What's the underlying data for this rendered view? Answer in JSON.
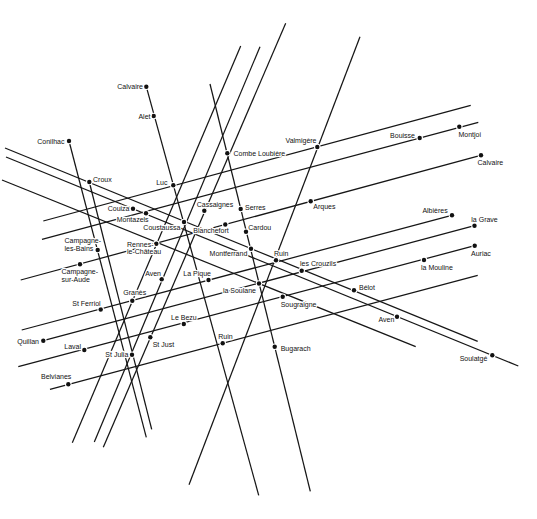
{
  "map": {
    "paper": "#ffffff",
    "ink": "#161616",
    "lines": [
      {
        "from": [
          5,
          148
        ],
        "to": [
          477.7,
          341.3
        ]
      },
      {
        "from": [
          6,
          157
        ],
        "to": [
          518.3,
          366
        ]
      },
      {
        "from": [
          2,
          180
        ],
        "to": [
          415.7,
          346.7
        ]
      },
      {
        "from": [
          43.3,
          221
        ],
        "to": [
          470.7,
          105.3
        ]
      },
      {
        "from": [
          42,
          239.3
        ],
        "to": [
          478.3,
          122.3
        ]
      },
      {
        "from": [
          20.7,
          280
        ],
        "to": [
          480.7,
          155.3
        ]
      },
      {
        "from": [
          21.7,
          330
        ],
        "to": [
          451.7,
          215.3
        ]
      },
      {
        "from": [
          43.3,
          340.7
        ],
        "to": [
          474.5,
          225.7
        ]
      },
      {
        "from": [
          18.3,
          366.7
        ],
        "to": [
          474.7,
          245.7
        ]
      },
      {
        "from": [
          50,
          389.3
        ],
        "to": [
          477.7,
          275.3
        ]
      },
      {
        "from": [
          146.3,
          86.7
        ],
        "to": [
          258.7,
          495.3
        ]
      },
      {
        "from": [
          210,
          84
        ],
        "to": [
          310.3,
          491.3
        ]
      },
      {
        "from": [
          69,
          141
        ],
        "to": [
          146.3,
          437.3
        ]
      },
      {
        "from": [
          89.3,
          182
        ],
        "to": [
          151.7,
          429.3
        ]
      },
      {
        "from": [
          240.7,
          46
        ],
        "to": [
          72.3,
          442.7
        ]
      },
      {
        "from": [
          260,
          46.7
        ],
        "to": [
          94.3,
          442
        ]
      },
      {
        "from": [
          285.7,
          23.3
        ],
        "to": [
          103.3,
          447.3
        ]
      },
      {
        "from": [
          360,
          36.7
        ],
        "to": [
          189,
          484.7
        ]
      }
    ],
    "places": [
      {
        "label": [
          "Calvaire"
        ],
        "dot": [
          146.3,
          86.7
        ],
        "text_at": [
          143,
          89
        ],
        "anchor": "end"
      },
      {
        "label": [
          "Alet"
        ],
        "dot": [
          153.7,
          116
        ],
        "text_at": [
          150.5,
          118.5
        ],
        "anchor": "end"
      },
      {
        "label": [
          "Conilhac"
        ],
        "dot": [
          69,
          141
        ],
        "text_at": [
          64.5,
          143.5
        ],
        "anchor": "end"
      },
      {
        "label": [
          "Combe Loubière"
        ],
        "dot": [
          227.3,
          153.3
        ],
        "text_at": [
          233.5,
          155.8
        ],
        "anchor": "start"
      },
      {
        "label": [
          "Valmigère"
        ],
        "dot": [
          317.3,
          147
        ],
        "text_at": [
          316.5,
          142.5
        ],
        "anchor": "end"
      },
      {
        "label": [
          "Bouisse"
        ],
        "dot": [
          419.7,
          138
        ],
        "text_at": [
          415,
          137.5
        ],
        "anchor": "end"
      },
      {
        "label": [
          "Montjoi"
        ],
        "dot": [
          459.3,
          126.7
        ],
        "text_at": [
          458.5,
          136.5
        ],
        "anchor": "start"
      },
      {
        "label": [
          "Calvaire"
        ],
        "dot": [
          481,
          155.3
        ],
        "text_at": [
          477.5,
          165
        ],
        "anchor": "start"
      },
      {
        "label": [
          "Croux"
        ],
        "dot": [
          89.3,
          182
        ],
        "text_at": [
          93,
          181.5
        ],
        "anchor": "start"
      },
      {
        "label": [
          "Luc"
        ],
        "dot": [
          173.3,
          185.3
        ],
        "text_at": [
          167.5,
          185
        ],
        "anchor": "end"
      },
      {
        "label": [
          "Couiza"
        ],
        "dot": [
          133,
          208.7
        ],
        "text_at": [
          129.5,
          211
        ],
        "anchor": "end"
      },
      {
        "label": [
          "Montazels"
        ],
        "dot": [
          146,
          213.3
        ],
        "text_at": [
          116.7,
          221.8
        ],
        "anchor": "start"
      },
      {
        "label": [
          "Cassaignes"
        ],
        "dot": [
          204.3,
          210.7
        ],
        "text_at": [
          196.7,
          207.3
        ],
        "anchor": "start"
      },
      {
        "label": [
          "Serres"
        ],
        "dot": [
          240.7,
          209
        ],
        "text_at": [
          245,
          209.5
        ],
        "anchor": "start"
      },
      {
        "label": [
          "Arques"
        ],
        "dot": [
          310.7,
          201.3
        ],
        "text_at": [
          313.3,
          208.8
        ],
        "anchor": "start"
      },
      {
        "label": [
          "Coustaussa"
        ],
        "dot": [
          184,
          222
        ],
        "text_at": [
          180.3,
          229.8
        ],
        "anchor": "end"
      },
      {
        "label": [
          "Blanchefort"
        ],
        "dot": [
          225.3,
          224.5
        ],
        "text_at": [
          193.3,
          233.2
        ],
        "anchor": "start"
      },
      {
        "label": [
          "Cardou"
        ],
        "dot": [
          246,
          231.7
        ],
        "text_at": [
          248.3,
          229.8
        ],
        "anchor": "start"
      },
      {
        "label": [
          "Campagne-",
          "les-Bains"
        ],
        "dot": [
          97.7,
          250
        ],
        "text_at": [
          64.5,
          243.2
        ],
        "anchor": "start"
      },
      {
        "label": [
          "Rennes-",
          "le-Château"
        ],
        "dot": [
          156.3,
          243.7
        ],
        "text_at": [
          127,
          246.6
        ],
        "anchor": "start"
      },
      {
        "label": [
          "Campagne-",
          "sur-Aude"
        ],
        "dot": [
          80,
          264.3
        ],
        "text_at": [
          61.5,
          274
        ],
        "anchor": "start"
      },
      {
        "label": [
          "Montferrand"
        ],
        "dot": [
          251,
          248.7
        ],
        "text_at": [
          247.3,
          255.8
        ],
        "anchor": "end"
      },
      {
        "label": [
          "Ruin"
        ],
        "dot": [
          276,
          260.3
        ],
        "text_at": [
          274,
          256.2
        ],
        "anchor": "start"
      },
      {
        "label": [
          "les Crouzils"
        ],
        "dot": [
          301.7,
          270.7
        ],
        "text_at": [
          300,
          265.5
        ],
        "anchor": "start"
      },
      {
        "label": [
          "Albières"
        ],
        "dot": [
          452,
          215.3
        ],
        "text_at": [
          447.7,
          212.5
        ],
        "anchor": "end"
      },
      {
        "label": [
          "la Grave"
        ],
        "dot": [
          474.5,
          225.7
        ],
        "text_at": [
          471.3,
          221.8
        ],
        "anchor": "start"
      },
      {
        "label": [
          "Auriac"
        ],
        "dot": [
          474.7,
          245.7
        ],
        "text_at": [
          471,
          255.8
        ],
        "anchor": "start"
      },
      {
        "label": [
          "la Mouline"
        ],
        "dot": [
          424,
          260
        ],
        "text_at": [
          421,
          270.2
        ],
        "anchor": "start"
      },
      {
        "label": [
          "Aven"
        ],
        "dot": [
          161.7,
          279.3
        ],
        "text_at": [
          161,
          275.8
        ],
        "anchor": "end"
      },
      {
        "label": [
          "La Pique"
        ],
        "dot": [
          208.5,
          280
        ],
        "text_at": [
          183.3,
          275.8
        ],
        "anchor": "start"
      },
      {
        "label": [
          "la Soulane"
        ],
        "dot": [
          259,
          283.5
        ],
        "text_at": [
          256,
          292.5
        ],
        "anchor": "end"
      },
      {
        "label": [
          "Granès"
        ],
        "dot": [
          132.3,
          300.7
        ],
        "text_at": [
          123.3,
          294.8
        ],
        "anchor": "start"
      },
      {
        "label": [
          "St Ferriol"
        ],
        "dot": [
          100.7,
          309.5
        ],
        "text_at": [
          100.7,
          305.8
        ],
        "anchor": "end"
      },
      {
        "label": [
          "Bélot"
        ],
        "dot": [
          354,
          290.3
        ],
        "text_at": [
          359,
          290.2
        ],
        "anchor": "start"
      },
      {
        "label": [
          "Sougraigne"
        ],
        "dot": [
          282.7,
          296.7
        ],
        "text_at": [
          280.7,
          307.2
        ],
        "anchor": "start"
      },
      {
        "label": [
          "Le Bezu"
        ],
        "dot": [
          183.8,
          324
        ],
        "text_at": [
          171,
          319.8
        ],
        "anchor": "start"
      },
      {
        "label": [
          "Aven"
        ],
        "dot": [
          397,
          316.7
        ],
        "text_at": [
          394.3,
          321.8
        ],
        "anchor": "end"
      },
      {
        "label": [
          "Quillan"
        ],
        "dot": [
          43.3,
          340.7
        ],
        "text_at": [
          39,
          343.5
        ],
        "anchor": "end"
      },
      {
        "label": [
          "Ruin"
        ],
        "dot": [
          222.7,
          343.3
        ],
        "text_at": [
          218.3,
          338.5
        ],
        "anchor": "start"
      },
      {
        "label": [
          "St Just"
        ],
        "dot": [
          150.3,
          337.3
        ],
        "text_at": [
          152.7,
          346.5
        ],
        "anchor": "start"
      },
      {
        "label": [
          "Bugarach"
        ],
        "dot": [
          274.7,
          346.7
        ],
        "text_at": [
          280.7,
          350.8
        ],
        "anchor": "start"
      },
      {
        "label": [
          "Laval"
        ],
        "dot": [
          84.3,
          350
        ],
        "text_at": [
          81,
          349.2
        ],
        "anchor": "end"
      },
      {
        "label": [
          "St Julia"
        ],
        "dot": [
          132,
          354.7
        ],
        "text_at": [
          128.3,
          356.8
        ],
        "anchor": "end"
      },
      {
        "label": [
          "Soulatgé"
        ],
        "dot": [
          492.3,
          355.3
        ],
        "text_at": [
          487.3,
          360.5
        ],
        "anchor": "end"
      },
      {
        "label": [
          "Belvianes"
        ],
        "dot": [
          68.3,
          384.3
        ],
        "text_at": [
          41,
          379.2
        ],
        "anchor": "start"
      }
    ]
  }
}
